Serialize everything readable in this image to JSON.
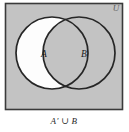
{
  "figure": {
    "caption": "A′ ∪ B",
    "universe_label": "U",
    "set_a_label": "A",
    "set_b_label": "B",
    "colors": {
      "page_background": "#ffffff",
      "universe_fill": "#c3c3c3",
      "universe_border": "#3a3a3a",
      "shaded_region_fill": "#c3c3c3",
      "unshaded_region_fill": "#fdfdfd",
      "circle_outline": "#262626",
      "label_text": "#1a1a1a",
      "caption_text": "#2a2a2a",
      "universe_label_text": "#5f5f5f"
    },
    "geometry": {
      "canvas_width": 129,
      "canvas_height": 132,
      "universe_rect": {
        "x": 5,
        "y": 3,
        "width": 118,
        "height": 107
      },
      "circle_a": {
        "cx": 52,
        "cy": 53,
        "r": 36
      },
      "circle_b": {
        "cx": 79,
        "cy": 53,
        "r": 36
      },
      "label_a_pos": {
        "x": 44,
        "y": 57
      },
      "label_b_pos": {
        "x": 84,
        "y": 57
      },
      "universe_label_pos": {
        "x": 116,
        "y": 11
      },
      "caption_pos": {
        "x": 64,
        "y": 124
      }
    },
    "shading": {
      "description": "A-prime union B shaded gray; region A minus B left white",
      "shaded_regions": [
        "outside-both-circles",
        "intersection-a-and-b",
        "b-only"
      ],
      "unshaded_regions": [
        "a-only"
      ]
    }
  }
}
